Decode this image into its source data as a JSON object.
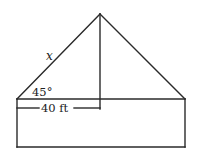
{
  "diagram": {
    "type": "house-roof-geometry",
    "labels": {
      "hypotenuse": "x",
      "angle": "45°",
      "half_base": "40 ft"
    },
    "colors": {
      "stroke": "#2a2a2a",
      "background": "#ffffff",
      "text": "#222222"
    },
    "geometry": {
      "apex": [
        100,
        14
      ],
      "roof_left": [
        17,
        99
      ],
      "roof_right": [
        185,
        99
      ],
      "wall_bottom_y": 147,
      "height_line_x": 100,
      "dimension_line_y": 108
    }
  }
}
